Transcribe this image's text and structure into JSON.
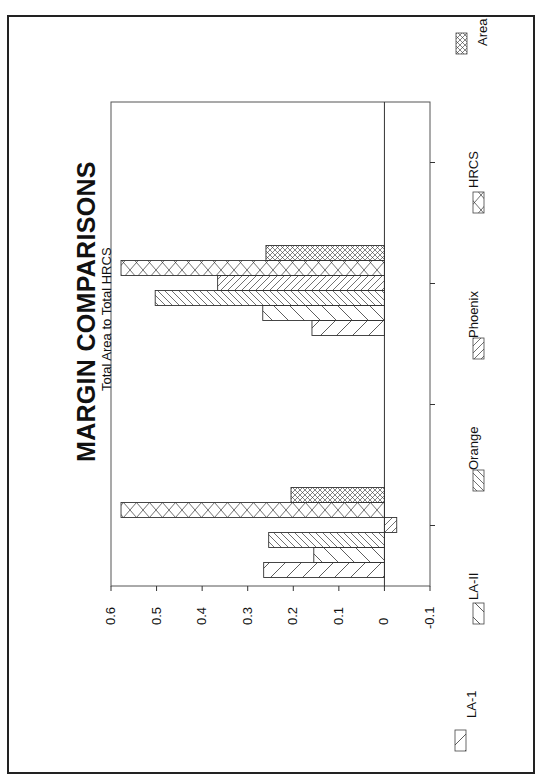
{
  "chart_data": {
    "type": "bar",
    "orientation": "rotated-90-ccw",
    "title": "MARGIN COMPARISONS",
    "subtitle": "Total Area to Total HRCS",
    "xlabel": "",
    "ylabel": "",
    "ylim": [
      -0.1,
      0.6
    ],
    "yticks": [
      "0.6",
      "0.5",
      "0.4",
      "0.3",
      "0.2",
      "0.1",
      "0",
      "-0.1"
    ],
    "grid": false,
    "legend_position": "bottom",
    "categories": [
      "",
      "",
      "",
      ""
    ],
    "series": [
      {
        "name": "LA-1",
        "pattern": "sparse-diagonal-right",
        "values": [
          0.265,
          null,
          0.159,
          null
        ]
      },
      {
        "name": "LA-II",
        "pattern": "sparse-diagonal-left",
        "values": [
          0.155,
          null,
          0.267,
          null
        ]
      },
      {
        "name": "Orange",
        "pattern": "dense-diagonal-right",
        "values": [
          0.254,
          null,
          0.503,
          null
        ]
      },
      {
        "name": "Phoenix",
        "pattern": "dense-diagonal-left",
        "values": [
          -0.027,
          null,
          0.366,
          null
        ]
      },
      {
        "name": "HRCS",
        "pattern": "large-crosshatch",
        "values": [
          0.578,
          null,
          0.578,
          null
        ]
      },
      {
        "name": "Area",
        "pattern": "fine-crosshatch",
        "values": [
          0.205,
          null,
          0.26,
          null
        ]
      }
    ]
  },
  "header": {
    "title": "MARGIN COMPARISONS",
    "subtitle": "Total Area to Total HRCS"
  },
  "axis": {
    "ticks": [
      "0.6",
      "0.5",
      "0.4",
      "0.3",
      "0.2",
      "0.1",
      "0",
      "-0.1"
    ]
  },
  "legend": {
    "items": [
      {
        "label": "LA-1"
      },
      {
        "label": "LA-II"
      },
      {
        "label": "Orange"
      },
      {
        "label": "Phoenix"
      },
      {
        "label": "HRCS"
      },
      {
        "label": "Area"
      }
    ]
  },
  "colors": {
    "line": "#333333",
    "frame": "#222222",
    "background": "#ffffff"
  }
}
